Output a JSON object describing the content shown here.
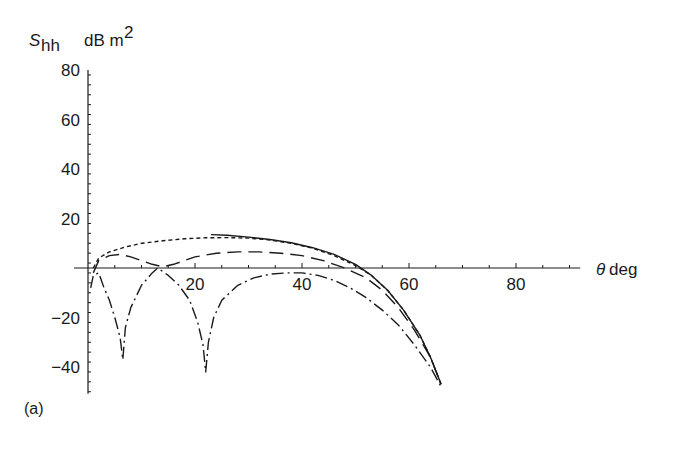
{
  "chart_data": {
    "type": "line",
    "title": "",
    "panel_label": "(a)",
    "ylabel_symbol": "S",
    "ylabel_subscript": "hh",
    "ylabel_unit": "dB m",
    "ylabel_unit_sup": "2",
    "xlabel_symbol": "θ",
    "xlabel_unit": "deg",
    "xlim": [
      0,
      92
    ],
    "ylim": [
      -50,
      80
    ],
    "xticks": [
      20,
      40,
      60,
      80
    ],
    "yticks": [
      80,
      60,
      40,
      20,
      -20,
      -40
    ],
    "grid": false,
    "legend": null,
    "series": [
      {
        "name": "solid",
        "style": "solid",
        "x": [
          23,
          26,
          30,
          34,
          38,
          42,
          46,
          50,
          53,
          56,
          59,
          62,
          64,
          66
        ],
        "y": [
          13.5,
          13.2,
          12.5,
          11.5,
          10.2,
          8.2,
          5.5,
          1.5,
          -3,
          -9,
          -17,
          -27,
          -36,
          -47
        ]
      },
      {
        "name": "short-dash",
        "style": "short-dash",
        "x": [
          1,
          2,
          4,
          7,
          10,
          14,
          18,
          22,
          26,
          30,
          34,
          38,
          42,
          46,
          50,
          53,
          56,
          59,
          62,
          64,
          66
        ],
        "y": [
          0,
          4,
          6.5,
          8.5,
          10,
          11,
          11.8,
          12.2,
          12.3,
          12.1,
          11.3,
          10,
          8,
          5,
          1,
          -3,
          -9,
          -17,
          -27,
          -36,
          -47
        ]
      },
      {
        "name": "long-dash",
        "style": "long-dash",
        "x": [
          1,
          2,
          4,
          6,
          8,
          10,
          12,
          14,
          16,
          20,
          24,
          28,
          32,
          36,
          40,
          44,
          48,
          52,
          55,
          58,
          61,
          64,
          66
        ],
        "y": [
          -2,
          3,
          5,
          5.5,
          4.5,
          3,
          1.5,
          0.5,
          1.5,
          4.5,
          6,
          6.5,
          6.5,
          6,
          5,
          3,
          0,
          -4,
          -9,
          -16,
          -25,
          -36,
          -47
        ]
      },
      {
        "name": "dash-dot",
        "style": "dash-dot",
        "x": [
          0.5,
          1,
          2,
          3,
          4,
          5,
          6,
          6.5,
          7,
          8,
          10,
          12,
          13,
          15,
          17,
          19,
          20.5,
          21.5,
          22,
          22.5,
          23.5,
          25,
          28,
          31,
          34,
          37,
          40,
          43,
          46,
          49,
          52,
          55,
          58,
          61,
          64,
          66
        ],
        "y": [
          -8,
          -3,
          -2,
          -8,
          -13,
          -20,
          -28,
          -37,
          -24,
          -16,
          -7,
          -2,
          0,
          -3,
          -7,
          -13,
          -22,
          -31,
          -42,
          -30,
          -20,
          -13,
          -7,
          -4,
          -2.5,
          -2,
          -2,
          -3,
          -5,
          -8,
          -12,
          -17,
          -23,
          -31,
          -40,
          -48
        ]
      }
    ]
  }
}
